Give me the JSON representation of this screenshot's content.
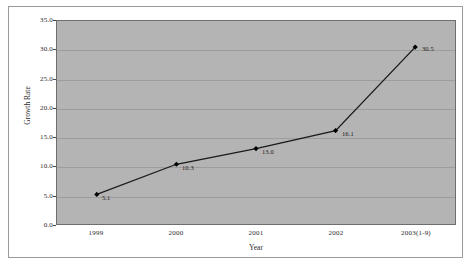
{
  "chart_data": {
    "type": "line",
    "title": "",
    "subtitle": "",
    "xlabel": "Year",
    "ylabel": "Growth Rate",
    "categories": [
      "1999",
      "2000",
      "2001",
      "2002",
      "2003(1-9)"
    ],
    "values": [
      5.1,
      10.3,
      13.0,
      16.1,
      30.5
    ],
    "point_labels": [
      "5.1",
      "10.3",
      "13.0",
      "16.1",
      "30.5"
    ],
    "series": [
      {
        "name": "Growth Rate",
        "values": [
          5.1,
          10.3,
          13.0,
          16.1,
          30.5
        ]
      }
    ],
    "ylim": [
      0.0,
      35.0
    ],
    "ytick_step": 5.0,
    "ytick_labels": [
      "0.0",
      "5.0",
      "10.0",
      "15.0",
      "20.0",
      "25.0",
      "30.0",
      "35.0"
    ],
    "ytick_values": [
      0.0,
      5.0,
      10.0,
      15.0,
      20.0,
      25.0,
      30.0,
      35.0
    ],
    "grid": true,
    "grid_axis": "y",
    "legend": false,
    "legend_position": "none",
    "colors": {
      "plot_background": "#b4b4b4",
      "figure_background": "#ffffff",
      "gridline": "#9d9d9d",
      "series_line": "#1a1a1a",
      "marker": "#000000",
      "axis": "#6e6e6e",
      "text": "#2b2b2b"
    },
    "marker": "diamond",
    "line_width": 1.3
  }
}
